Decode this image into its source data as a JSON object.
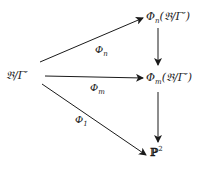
{
  "diagram": {
    "type": "commutative-diagram",
    "nodes": [
      {
        "id": "source",
        "label": "𝔅/Γ′",
        "display": "𝔅/Γ̃′"
      },
      {
        "id": "phi_n_image",
        "label": "Φn(𝔅/Γ′)",
        "symbol": "Φ",
        "sub": "n",
        "arg": "(𝔅/Γ′)"
      },
      {
        "id": "phi_m_image",
        "label": "Φm(𝔅/Γ′)",
        "symbol": "Φ",
        "sub": "m",
        "arg": "(𝔅/Γ′)"
      },
      {
        "id": "projective_plane",
        "label": "ℙ²",
        "base": "ℙ",
        "sup": "2"
      }
    ],
    "edges": [
      {
        "from": "source",
        "to": "phi_n_image",
        "symbol": "Φ",
        "sub": "n"
      },
      {
        "from": "source",
        "to": "phi_m_image",
        "symbol": "Φ",
        "sub": "m"
      },
      {
        "from": "source",
        "to": "projective_plane",
        "symbol": "Φ",
        "sub": "1"
      },
      {
        "from": "phi_n_image",
        "to": "phi_m_image",
        "symbol": "",
        "sub": ""
      },
      {
        "from": "phi_m_image",
        "to": "projective_plane",
        "symbol": "",
        "sub": ""
      }
    ]
  }
}
